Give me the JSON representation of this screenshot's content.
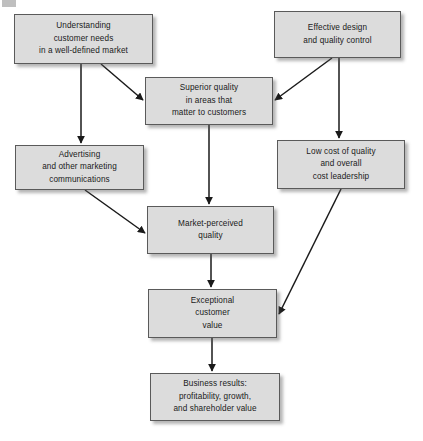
{
  "diagram": {
    "background_color": "#ffffff",
    "node_fill_color": "#dcdcdc",
    "node_border_color": "#5a5a5a",
    "edge_color": "#1a1a1a",
    "nodes": [
      {
        "id": "understanding-customer-needs",
        "label": "Understanding\ncustomer needs\nin a well-defined market",
        "x": 14,
        "y": 14,
        "w": 139,
        "h": 50
      },
      {
        "id": "effective-design",
        "label": "Effective design\nand quality control",
        "x": 274,
        "y": 11,
        "w": 127,
        "h": 47
      },
      {
        "id": "superior-quality",
        "label": "Superior quality\nin areas that\nmatter to customers",
        "x": 145,
        "y": 77,
        "w": 128,
        "h": 48
      },
      {
        "id": "advertising",
        "label": "Advertising\nand other marketing\ncommunications",
        "x": 15,
        "y": 145,
        "w": 129,
        "h": 45
      },
      {
        "id": "low-cost-of-quality",
        "label": "Low cost of quality\nand overall\ncost leadership",
        "x": 277,
        "y": 140,
        "w": 128,
        "h": 49
      },
      {
        "id": "market-perceived-quality",
        "label": "Market-perceived\nquality",
        "x": 147,
        "y": 206,
        "w": 127,
        "h": 48
      },
      {
        "id": "exceptional-customer-value",
        "label": "Exceptional\ncustomer\nvalue",
        "x": 148,
        "y": 289,
        "w": 129,
        "h": 49
      },
      {
        "id": "business-results",
        "label": "Business results:\nprofitability, growth,\nand shareholder value",
        "x": 150,
        "y": 373,
        "w": 130,
        "h": 48
      }
    ],
    "edges": [
      {
        "id": "understanding-to-advertising",
        "from": "understanding-customer-needs",
        "to": "advertising",
        "x1": 81,
        "y1": 64,
        "x2": 81,
        "y2": 143
      },
      {
        "id": "understanding-to-superior-quality",
        "from": "understanding-customer-needs",
        "to": "superior-quality",
        "x1": 101,
        "y1": 64,
        "x2": 143,
        "y2": 100
      },
      {
        "id": "effective-design-to-superior-quality",
        "from": "effective-design",
        "to": "superior-quality",
        "x1": 332,
        "y1": 58,
        "x2": 275,
        "y2": 100
      },
      {
        "id": "effective-design-to-low-cost",
        "from": "effective-design",
        "to": "low-cost-of-quality",
        "x1": 339,
        "y1": 58,
        "x2": 339,
        "y2": 138
      },
      {
        "id": "superior-quality-to-market-perceived",
        "from": "superior-quality",
        "to": "market-perceived-quality",
        "x1": 209,
        "y1": 125,
        "x2": 209,
        "y2": 204
      },
      {
        "id": "advertising-to-market-perceived",
        "from": "advertising",
        "to": "market-perceived-quality",
        "x1": 85,
        "y1": 190,
        "x2": 145,
        "y2": 233
      },
      {
        "id": "market-perceived-to-exceptional",
        "from": "market-perceived-quality",
        "to": "exceptional-customer-value",
        "x1": 211,
        "y1": 254,
        "x2": 211,
        "y2": 287
      },
      {
        "id": "low-cost-to-exceptional",
        "from": "low-cost-of-quality",
        "to": "exceptional-customer-value",
        "x1": 341,
        "y1": 189,
        "x2": 279,
        "y2": 314
      },
      {
        "id": "exceptional-to-business-results",
        "from": "exceptional-customer-value",
        "to": "business-results",
        "x1": 212,
        "y1": 338,
        "x2": 212,
        "y2": 371
      }
    ]
  }
}
